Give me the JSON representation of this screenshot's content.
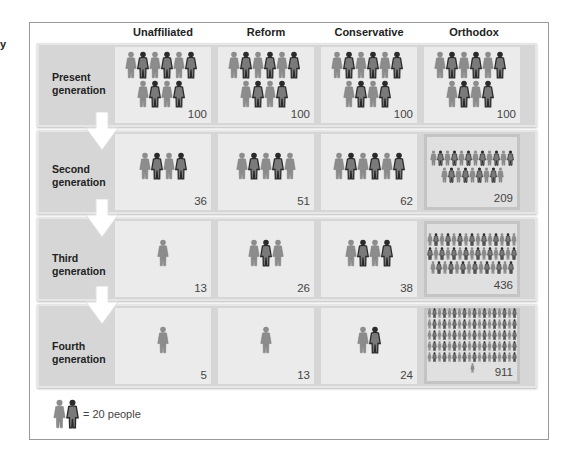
{
  "cut_label": "y",
  "columns": [
    "Unaffiliated",
    "Reform",
    "Conservative",
    "Orthodox"
  ],
  "rows": [
    {
      "label_line1": "Present",
      "label_line2": "generation",
      "values": [
        "100",
        "100",
        "100",
        "100"
      ]
    },
    {
      "label_line1": "Second",
      "label_line2": "generation",
      "values": [
        "36",
        "51",
        "62",
        "209"
      ]
    },
    {
      "label_line1": "Third",
      "label_line2": "generation",
      "values": [
        "13",
        "26",
        "38",
        "436"
      ]
    },
    {
      "label_line1": "Fourth",
      "label_line2": "generation",
      "values": [
        "5",
        "13",
        "24",
        "911"
      ]
    }
  ],
  "legend": {
    "icon": "person-pair-icon",
    "text": "= 20 people"
  },
  "colors": {
    "frame": "#999999",
    "band": "#d6d6d6",
    "cell": "#ebebeb",
    "figure_light": "#8c8c8c",
    "figure_dark": "#2a2a2a"
  },
  "chart_data": {
    "type": "table",
    "title": "",
    "categories": [
      "Unaffiliated",
      "Reform",
      "Conservative",
      "Orthodox"
    ],
    "unit": "1 icon pair = 20 people",
    "series": [
      {
        "name": "Present generation",
        "values": [
          100,
          100,
          100,
          100
        ]
      },
      {
        "name": "Second generation",
        "values": [
          36,
          51,
          62,
          209
        ]
      },
      {
        "name": "Third generation",
        "values": [
          13,
          26,
          38,
          436
        ]
      },
      {
        "name": "Fourth generation",
        "values": [
          5,
          13,
          24,
          911
        ]
      }
    ]
  }
}
